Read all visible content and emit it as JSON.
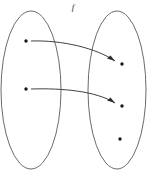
{
  "diagram": {
    "type": "function-mapping-diagram",
    "label": "f",
    "label_position": {
      "x": 73,
      "y": 10
    },
    "canvas": {
      "width": 149,
      "height": 176
    },
    "colors": {
      "background": "#ffffff",
      "ellipse_stroke": "#5a5a5a",
      "dot_fill": "#1a1a1a",
      "arrow_stroke": "#2b2b2b",
      "label_fill": "#333333"
    },
    "sets": [
      {
        "name": "domain-set",
        "role": "domain",
        "ellipse": {
          "cx": 31,
          "cy": 90,
          "rx": 30,
          "ry": 79
        },
        "elements": [
          {
            "name": "domain-element-1",
            "cx": 26,
            "cy": 41,
            "r": 1.7
          },
          {
            "name": "domain-element-2",
            "cx": 26,
            "cy": 89,
            "r": 1.7
          }
        ]
      },
      {
        "name": "codomain-set",
        "role": "codomain",
        "ellipse": {
          "cx": 117,
          "cy": 90,
          "rx": 29,
          "ry": 79
        },
        "elements": [
          {
            "name": "codomain-element-1",
            "cx": 122,
            "cy": 64,
            "r": 1.7
          },
          {
            "name": "codomain-element-2",
            "cx": 122,
            "cy": 106,
            "r": 1.7
          },
          {
            "name": "codomain-element-3",
            "cx": 120,
            "cy": 139,
            "r": 1.7
          }
        ]
      }
    ],
    "mappings": [
      {
        "name": "mapping-arrow-1",
        "from": "domain-element-1",
        "to": "codomain-element-1",
        "path": "M 31 41 C 62 40 96 48 115 61",
        "head": "M 115 61 L 107 58.5 L 110.5 55.5 Z"
      },
      {
        "name": "mapping-arrow-2",
        "from": "domain-element-2",
        "to": "codomain-element-2",
        "path": "M 31 89 C 62 88 96 91 115 103",
        "head": "M 115 103 L 107 100.5 L 110.5 97.5 Z"
      }
    ]
  }
}
